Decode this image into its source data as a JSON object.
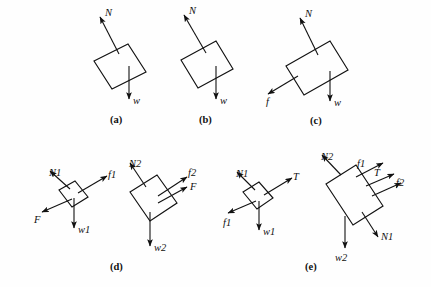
{
  "figure": {
    "kind": "free-body-diagram-set",
    "background_color": "#fefefe",
    "ink_color": "#111111",
    "panels": [
      {
        "id": "a",
        "caption": "(a)",
        "description": "single block on incline with normal force and weight",
        "bodies": [
          {
            "name": "block",
            "labels": [
              "N",
              "w"
            ]
          }
        ]
      },
      {
        "id": "b",
        "caption": "(b)",
        "description": "single block on incline with normal force and weight",
        "bodies": [
          {
            "name": "block",
            "labels": [
              "N",
              "w"
            ]
          }
        ]
      },
      {
        "id": "c",
        "caption": "(c)",
        "description": "single block on incline with normal force, friction and weight",
        "bodies": [
          {
            "name": "block",
            "labels": [
              "N",
              "f",
              "w"
            ]
          }
        ]
      },
      {
        "id": "d",
        "caption": "(d)",
        "description": "two stacked blocks, each with its own free-body diagram",
        "bodies": [
          {
            "name": "upper-block",
            "labels": [
              "N1",
              "f1",
              "F",
              "w1"
            ]
          },
          {
            "name": "lower-block",
            "labels": [
              "N2",
              "f2",
              "F",
              "w2"
            ]
          }
        ]
      },
      {
        "id": "e",
        "caption": "(e)",
        "description": "two blocks connected by a cord, each with its own free-body diagram",
        "bodies": [
          {
            "name": "upper-block",
            "labels": [
              "N1",
              "T",
              "f1",
              "w1"
            ]
          },
          {
            "name": "lower-block",
            "labels": [
              "N2",
              "f1",
              "T",
              "f2",
              "N1",
              "w2"
            ]
          }
        ]
      }
    ]
  },
  "labels": {
    "a": {
      "N": "N",
      "w": "w",
      "caption": "(a)"
    },
    "b": {
      "N": "N",
      "w": "w",
      "caption": "(b)"
    },
    "c": {
      "N": "N",
      "f": "f",
      "w": "w",
      "caption": "(c)"
    },
    "d1": {
      "N1": "N1",
      "f1": "f1",
      "F": "F",
      "w1": "w1"
    },
    "d2": {
      "N2": "N2",
      "f2": "f2",
      "F": "F",
      "w2": "w2"
    },
    "d_caption": "(d)",
    "e1": {
      "N1": "N1",
      "T": "T",
      "f1": "f1",
      "w1": "w1"
    },
    "e2": {
      "N2": "N2",
      "f1": "f1",
      "T": "T",
      "f2": "f2",
      "N1": "N1",
      "w2": "w2"
    },
    "e_caption": "(e)"
  }
}
